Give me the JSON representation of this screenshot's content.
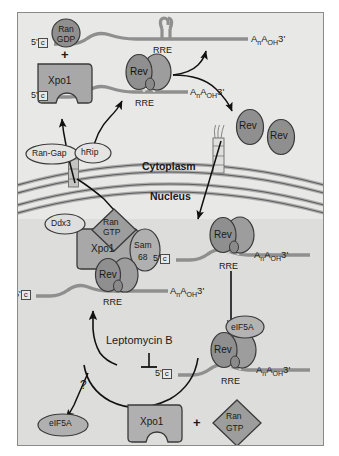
{
  "figure": {
    "compartments": {
      "cytoplasm": "Cytoplasm",
      "nucleus": "Nucleus"
    }
  },
  "colors": {
    "background": "#e8e8e6",
    "nucleoplasm": "#dcdcda",
    "protein_fill": "#9a9a9a",
    "protein_fill_light": "#b0b0b0",
    "protein_dark": "#8a8a8a",
    "rna_strand": "#8c8c8c",
    "membrane": "#a0a0a0",
    "outline": "#3a3a3a",
    "text": "#1a1a1a"
  },
  "labels": {
    "ran_gdp": "Ran\nGDP",
    "ran_gdp_l1": "Ran",
    "ran_gdp_l2": "GDP",
    "ran_gtp_l1": "Ran",
    "ran_gtp_l2": "GTP",
    "xpo1": "Xpo1",
    "plus": "+",
    "ran_gap": "Ran-Gap",
    "hrip": "hRip",
    "ddx3": "Ddx3",
    "sam68_l1": "Sam",
    "sam68_l2": "68",
    "rev": "Rev",
    "eif5a": "eIF5A",
    "rre": "RRE",
    "five_prime": "5'",
    "cap": "c",
    "poly_a": "AnAOH3'",
    "leptomycin": "Leptomycin B",
    "question": "?"
  },
  "nodes": [
    {
      "id": "ran-gdp",
      "label": "Ran GDP",
      "shape": "circle",
      "compartment": "cytoplasm"
    },
    {
      "id": "xpo1-cyto",
      "label": "Xpo1",
      "shape": "notched-block",
      "compartment": "cytoplasm"
    },
    {
      "id": "ran-gap",
      "label": "Ran-Gap",
      "shape": "oval",
      "compartment": "cytoplasm"
    },
    {
      "id": "hrip",
      "label": "hRip",
      "shape": "oval",
      "compartment": "membrane"
    },
    {
      "id": "rev-rre-cyto",
      "label": "Rev",
      "shape": "oval-pair",
      "compartment": "cytoplasm"
    },
    {
      "id": "rre-free-top",
      "label": "RRE",
      "shape": "stem-loop",
      "compartment": "cytoplasm"
    },
    {
      "id": "rev-free-1",
      "label": "Rev",
      "shape": "oval",
      "compartment": "cytoplasm"
    },
    {
      "id": "rev-free-2",
      "label": "Rev",
      "shape": "oval",
      "compartment": "cytoplasm"
    },
    {
      "id": "ddx3",
      "label": "Ddx3",
      "shape": "oval",
      "compartment": "nucleus"
    },
    {
      "id": "ran-gtp-nuc",
      "label": "Ran GTP",
      "shape": "diamond",
      "compartment": "nucleus"
    },
    {
      "id": "xpo1-nuc",
      "label": "Xpo1",
      "shape": "block",
      "compartment": "nucleus"
    },
    {
      "id": "sam68",
      "label": "Sam 68",
      "shape": "oval",
      "compartment": "nucleus"
    },
    {
      "id": "rev-export-complex",
      "label": "Rev",
      "shape": "oval-pair",
      "compartment": "nucleus"
    },
    {
      "id": "rev-rre-nuc",
      "label": "Rev",
      "shape": "oval-pair",
      "compartment": "nucleus"
    },
    {
      "id": "eif5a-bound",
      "label": "eIF5A",
      "shape": "oval",
      "compartment": "nucleus"
    },
    {
      "id": "rev-rre-eif5a",
      "label": "Rev",
      "shape": "oval-pair",
      "compartment": "nucleus"
    },
    {
      "id": "eif5a-free",
      "label": "eIF5A",
      "shape": "oval",
      "compartment": "nucleus"
    },
    {
      "id": "xpo1-free-nuc",
      "label": "Xpo1",
      "shape": "notched-block",
      "compartment": "nucleus"
    },
    {
      "id": "ran-gtp-free",
      "label": "Ran GTP",
      "shape": "diamond",
      "compartment": "nucleus"
    }
  ],
  "edges": [
    {
      "from": "membrane-pore-left",
      "to": "xpo1-cyto",
      "type": "arrow"
    },
    {
      "from": "hrip",
      "to": "rev-rre-cyto",
      "type": "arrow"
    },
    {
      "from": "rev-rre-cyto",
      "to": "rre-free-top",
      "type": "arrow"
    },
    {
      "from": "rev-rre-cyto",
      "to": "rev-free-1",
      "type": "arrow"
    },
    {
      "from": "membrane-pore-right",
      "to": "rev-rre-nuc",
      "type": "arrow"
    },
    {
      "from": "rev-rre-nuc",
      "to": "rev-rre-eif5a",
      "type": "arrow"
    },
    {
      "from": "rev-export-complex",
      "to": "membrane-pore-left",
      "type": "arrow"
    },
    {
      "from": "leptomycin",
      "to": "export-path",
      "type": "inhibition"
    },
    {
      "from": "xpo1-free-nuc",
      "to": "rev-rre-eif5a",
      "type": "arrow"
    },
    {
      "from": "export-path",
      "to": "eif5a-free",
      "type": "arrow-question"
    }
  ]
}
